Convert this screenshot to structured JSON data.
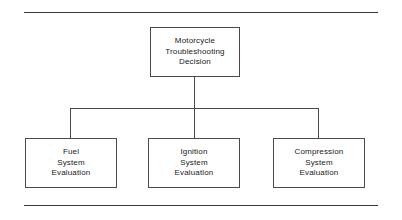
{
  "figure": {
    "colors": {
      "background": "#ffffff",
      "rule": "#3a3a3a",
      "box_border": "#4a4a4a",
      "connector": "#4a4a4a",
      "text": "#1a1a1a"
    }
  },
  "rules": {
    "top_label": "top-horizontal-rule",
    "bottom_label": "bottom-horizontal-rule"
  },
  "nodes": {
    "root": {
      "id": "motorcycle-troubleshooting-decision",
      "lines": [
        "Motorcycle",
        "Troubleshooting",
        "Decision"
      ]
    },
    "children": [
      {
        "id": "fuel-system-evaluation",
        "lines": [
          "Fuel",
          "System",
          "Evaluation"
        ]
      },
      {
        "id": "ignition-system-evaluation",
        "lines": [
          "Ignition",
          "System",
          "Evaluation"
        ]
      },
      {
        "id": "compression-system-evaluation",
        "lines": [
          "Compression",
          "System",
          "Evaluation"
        ]
      }
    ]
  },
  "connectors": {
    "stem": "root-to-bus-stem",
    "bus": "horizontal-distribution-bus",
    "drops": [
      "drop-to-fuel",
      "drop-to-ignition",
      "drop-to-compression"
    ]
  }
}
